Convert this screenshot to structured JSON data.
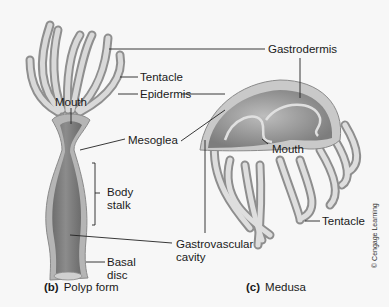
{
  "figure": {
    "polyp": {
      "caption_letter": "(b)",
      "caption_text": "Polyp form",
      "labels": {
        "tentacle": "Tentacle",
        "epidermis": "Epidermis",
        "mouth": "Mouth",
        "mesoglea": "Mesoglea",
        "body_stalk_line1": "Body",
        "body_stalk_line2": "stalk",
        "basal_disc_line1": "Basal",
        "basal_disc_line2": "disc"
      }
    },
    "medusa": {
      "caption_letter": "(c)",
      "caption_text": "Medusa",
      "labels": {
        "gastrodermis": "Gastrodermis",
        "mouth": "Mouth",
        "tentacle": "Tentacle"
      }
    },
    "shared": {
      "gastrovascular_line1": "Gastrovascular",
      "gastrovascular_line2": "cavity"
    },
    "credit": "© Cengage Learning",
    "colors": {
      "background": "#f7f7f7",
      "tissue_light": "#d6d6d6",
      "tissue_mid": "#a9a9a9",
      "tissue_dark": "#7a7a7a",
      "leader_line": "#222222"
    }
  }
}
